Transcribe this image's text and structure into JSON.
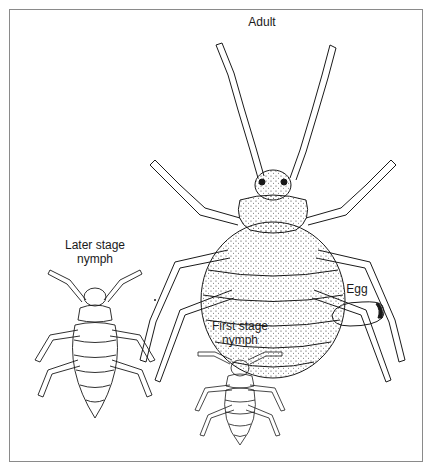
{
  "figure": {
    "labels": {
      "adult": "Adult",
      "later_stage_line1": "Later stage",
      "later_stage_line2": "nymph",
      "first_stage_line1": "First stage",
      "first_stage_line2": "nymph",
      "egg": "Egg"
    },
    "colors": {
      "ink": "#1a1a1a",
      "frame": "#8a8a8a",
      "background": "#ffffff"
    }
  }
}
